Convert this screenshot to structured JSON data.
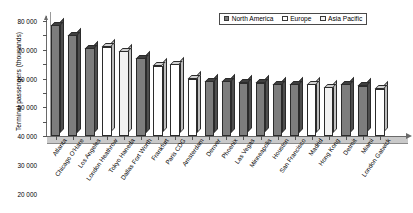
{
  "chart_data": {
    "type": "bar",
    "title": "",
    "subtitle": "",
    "xlabel": "",
    "ylabel": "Terminal passengers (thousands)",
    "ylim": [
      0,
      80000
    ],
    "ytick_labels": [
      "80 000",
      "70 000",
      "60 000",
      "50 000",
      "40 000",
      "30 000",
      "20 000",
      "10 000",
      "0"
    ],
    "ytick_values": [
      80000,
      70000,
      60000,
      50000,
      40000,
      30000,
      20000,
      10000,
      0
    ],
    "grid": false,
    "legend_position": "top-right",
    "legend": [
      {
        "key": "north_america",
        "label": "North America",
        "color": "#7d7d7d"
      },
      {
        "key": "europe",
        "label": "Europe",
        "color": "#ffffff"
      },
      {
        "key": "asia_pacific",
        "label": "Asia Pacific",
        "color": "#f2f2f2"
      }
    ],
    "categories": [
      "Atlanta",
      "Chicago O'Hare",
      "Los Angeles",
      "London Heathrow",
      "Tokyo Haneda",
      "Dallas Fort Worth",
      "Frankfurt",
      "Paris CDG",
      "Amsterdam",
      "Denver",
      "Phoenix",
      "Las Vegas",
      "Minneapolis",
      "Houston",
      "San Francisco",
      "Madrid",
      "Hong Kong",
      "Detroit",
      "Miami",
      "London Gatwick"
    ],
    "values": [
      77000,
      70000,
      61000,
      62000,
      59000,
      54000,
      49000,
      50000,
      40000,
      38000,
      38000,
      37000,
      37000,
      36000,
      36000,
      36000,
      34000,
      36000,
      35000,
      33000
    ],
    "regions": [
      "north_america",
      "north_america",
      "north_america",
      "europe",
      "asia_pacific",
      "north_america",
      "europe",
      "europe",
      "europe",
      "north_america",
      "north_america",
      "north_america",
      "north_america",
      "north_america",
      "north_america",
      "europe",
      "asia_pacific",
      "north_america",
      "north_america",
      "europe"
    ]
  }
}
